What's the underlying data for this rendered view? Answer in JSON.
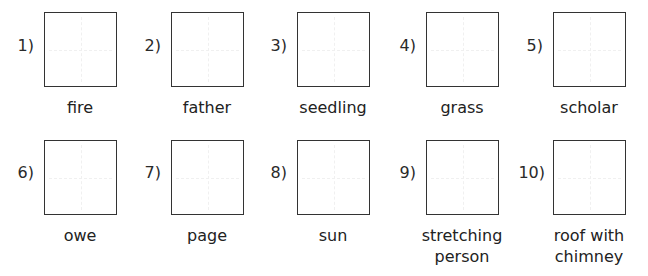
{
  "worksheet": {
    "items": [
      {
        "number": "1)",
        "word": "fire"
      },
      {
        "number": "2)",
        "word": "father"
      },
      {
        "number": "3)",
        "word": "seedling"
      },
      {
        "number": "4)",
        "word": "grass"
      },
      {
        "number": "5)",
        "word": "scholar"
      },
      {
        "number": "6)",
        "word": "owe"
      },
      {
        "number": "7)",
        "word": "page"
      },
      {
        "number": "8)",
        "word": "sun"
      },
      {
        "number": "9)",
        "word": "stretching\nperson"
      },
      {
        "number": "10)",
        "word": "roof with\nchimney"
      }
    ]
  }
}
